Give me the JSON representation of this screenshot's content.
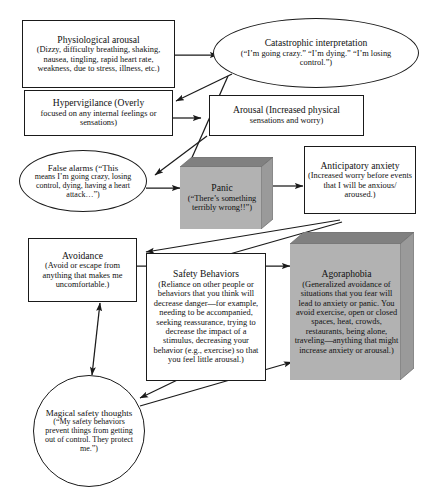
{
  "diagram": {
    "background_color": "#ffffff",
    "line_color": "#1a1a1a",
    "shaded_box_color": "#b2b2b2",
    "shaded_box_top_color": "#808080",
    "shaded_box_side_color": "#9a9a9a"
  },
  "nodes": {
    "physiological_arousal": {
      "shape": "rectangle",
      "title": "Physiological arousal",
      "body": "(Dizzy, difficulty breathing, shaking, nausea, tingling, rapid heart rate, weakness, due to stress, illness, etc.)"
    },
    "catastrophic_interpretation": {
      "shape": "ellipse",
      "title": "Catastrophic interpretation",
      "body": "(“I’m going crazy.” “I’m dying.” “I’m losing control.”)"
    },
    "hypervigilance": {
      "shape": "rectangle",
      "title": "Hypervigilance (Overly",
      "body": "focused on any internal feelings or sensations)"
    },
    "arousal": {
      "shape": "rectangle",
      "title": "Arousal (Increased physical",
      "body": "sensations and worry)"
    },
    "false_alarms": {
      "shape": "ellipse",
      "title": "False alarms (“This",
      "body": "means I’m going crazy, losing control, dying, having a heart attack…”)"
    },
    "panic": {
      "shape": "box3d",
      "title": "Panic",
      "body": "(“There’s something terribly wrong!!”)"
    },
    "anticipatory_anxiety": {
      "shape": "rectangle",
      "title": "Anticipatory anxiety",
      "body": "(Increased worry before events that I will be anxious/ aroused.)"
    },
    "avoidance": {
      "shape": "rectangle",
      "title": "Avoidance",
      "body": "(Avoid or escape from anything that makes me uncomfortable.)"
    },
    "safety_behaviors": {
      "shape": "rectangle",
      "title": "Safety Behaviors",
      "body": "(Reliance on other people or behaviors that you think will decrease danger—for example, needing to be accompanied, seeking reassurance, trying to decrease the impact of a stimulus, decreasing your behavior (e.g., exercise) so that you feel little arousal.)"
    },
    "agoraphobia": {
      "shape": "box3d",
      "title": "Agoraphobia",
      "body": "(Generalized avoidance of situations that you fear will lead to anxiety or panic. You avoid exercise, open or closed spaces, heat, crowds, restaurants, being alone, traveling—anything that might increase anxiety or arousal.)"
    },
    "magical_safety_thoughts": {
      "shape": "circle",
      "title": "Magical safety thoughts",
      "body": "(“My safety behaviors prevent things from getting out of control. They protect me.”)"
    }
  },
  "edges": [
    {
      "from": "physiological_arousal",
      "to": "catastrophic_interpretation",
      "arrow": "single"
    },
    {
      "from": "catastrophic_interpretation",
      "to": "hypervigilance",
      "arrow": "single"
    },
    {
      "from": "hypervigilance",
      "to": "arousal",
      "arrow": "single"
    },
    {
      "from": "arousal",
      "to": "false_alarms",
      "arrow": "single"
    },
    {
      "from": "catastrophic_interpretation",
      "to": "panic",
      "arrow": "single"
    },
    {
      "from": "false_alarms",
      "to": "panic",
      "arrow": "single"
    },
    {
      "from": "panic",
      "to": "anticipatory_anxiety",
      "arrow": "single"
    },
    {
      "from": "anticipatory_anxiety",
      "to": "avoidance",
      "arrow": "single"
    },
    {
      "from": "anticipatory_anxiety",
      "to": "safety_behaviors",
      "arrow": "single"
    },
    {
      "from": "avoidance",
      "to": "agoraphobia",
      "arrow": "single"
    },
    {
      "from": "avoidance",
      "to": "magical_safety_thoughts",
      "arrow": "double"
    },
    {
      "from": "safety_behaviors",
      "to": "magical_safety_thoughts",
      "arrow": "double"
    },
    {
      "from": "magical_safety_thoughts",
      "to": "agoraphobia",
      "arrow": "single"
    }
  ]
}
